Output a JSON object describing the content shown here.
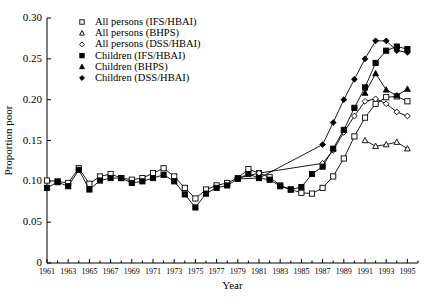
{
  "chart_data": {
    "type": "line",
    "title": "",
    "xlabel": "Year",
    "ylabel": "Proportion poor",
    "xlim": [
      1961,
      1996
    ],
    "ylim": [
      0,
      0.3
    ],
    "yticks": [
      "0",
      "0.05",
      "0.10",
      "0.15",
      "0.20",
      "0.25",
      "0.30"
    ],
    "ytick_values": [
      0,
      0.05,
      0.1,
      0.15,
      0.2,
      0.25,
      0.3
    ],
    "xticks": [
      "1961",
      "1963",
      "1965",
      "1967",
      "1969",
      "1971",
      "1973",
      "1975",
      "1977",
      "1979",
      "1981",
      "1983",
      "1985",
      "1987",
      "1989",
      "1991",
      "1993",
      "1995"
    ],
    "xtick_values": [
      1961,
      1963,
      1965,
      1967,
      1969,
      1971,
      1973,
      1975,
      1977,
      1979,
      1981,
      1983,
      1985,
      1987,
      1989,
      1991,
      1993,
      1995
    ],
    "minor_xticks": [
      1962,
      1964,
      1966,
      1968,
      1970,
      1972,
      1974,
      1976,
      1978,
      1980,
      1982,
      1984,
      1986,
      1988,
      1990,
      1992,
      1994,
      1996
    ],
    "grid": false,
    "legend_position": "top-center",
    "series": [
      {
        "name": "All persons (IFS/HBAI)",
        "marker": "open-square",
        "x": [
          1961,
          1962,
          1963,
          1964,
          1965,
          1966,
          1967,
          1968,
          1969,
          1970,
          1971,
          1972,
          1973,
          1974,
          1975,
          1976,
          1977,
          1978,
          1979,
          1980,
          1981,
          1982,
          1983,
          1984,
          1985,
          1986,
          1987,
          1988,
          1989,
          1990,
          1991,
          1992,
          1993,
          1994,
          1995
        ],
        "values": [
          0.101,
          0.1,
          0.098,
          0.116,
          0.097,
          0.106,
          0.109,
          0.104,
          0.102,
          0.104,
          0.11,
          0.116,
          0.106,
          0.092,
          0.079,
          0.09,
          0.095,
          0.098,
          0.104,
          0.115,
          0.11,
          0.105,
          0.095,
          0.09,
          0.086,
          0.085,
          0.092,
          0.106,
          0.128,
          0.155,
          0.178,
          0.195,
          0.203,
          0.204,
          0.198
        ]
      },
      {
        "name": "All persons (BHPS)",
        "marker": "open-triangle",
        "x": [
          1991,
          1992,
          1993,
          1994,
          1995
        ],
        "values": [
          0.15,
          0.143,
          0.145,
          0.148,
          0.14
        ]
      },
      {
        "name": "All persons (DSS/HBAI)",
        "marker": "open-diamond",
        "x": [
          1979,
          1981,
          1987,
          1988,
          1989,
          1990,
          1991,
          1992,
          1993,
          1994,
          1995
        ],
        "values": [
          0.104,
          0.11,
          0.122,
          0.138,
          0.16,
          0.18,
          0.198,
          0.201,
          0.195,
          0.185,
          0.18
        ]
      },
      {
        "name": "Children (IFS/HBAI)",
        "marker": "filled-square",
        "x": [
          1961,
          1962,
          1963,
          1964,
          1965,
          1966,
          1967,
          1968,
          1969,
          1970,
          1971,
          1972,
          1973,
          1974,
          1975,
          1976,
          1977,
          1978,
          1979,
          1980,
          1981,
          1982,
          1983,
          1984,
          1985,
          1986,
          1987,
          1988,
          1989,
          1990,
          1991,
          1992,
          1993,
          1994,
          1995
        ],
        "values": [
          0.092,
          0.099,
          0.094,
          0.114,
          0.09,
          0.101,
          0.104,
          0.104,
          0.098,
          0.1,
          0.104,
          0.108,
          0.1,
          0.084,
          0.068,
          0.085,
          0.092,
          0.095,
          0.103,
          0.109,
          0.104,
          0.102,
          0.094,
          0.09,
          0.093,
          0.109,
          0.118,
          0.14,
          0.163,
          0.19,
          0.215,
          0.245,
          0.26,
          0.265,
          0.262
        ]
      },
      {
        "name": "Children (BHPS)",
        "marker": "filled-triangle",
        "x": [
          1991,
          1992,
          1993,
          1994,
          1995
        ],
        "values": [
          0.208,
          0.232,
          0.212,
          0.205,
          0.213
        ]
      },
      {
        "name": "Children (DSS/HBAI)",
        "marker": "filled-diamond",
        "x": [
          1979,
          1981,
          1987,
          1988,
          1989,
          1990,
          1991,
          1992,
          1993,
          1994,
          1995
        ],
        "values": [
          0.103,
          0.104,
          0.145,
          0.172,
          0.2,
          0.225,
          0.25,
          0.272,
          0.272,
          0.26,
          0.258
        ]
      }
    ]
  },
  "legend": {
    "items": [
      {
        "label": "All persons (IFS/HBAI)",
        "marker": "open-square"
      },
      {
        "label": "All persons (BHPS)",
        "marker": "open-triangle"
      },
      {
        "label": "All persons (DSS/HBAI)",
        "marker": "open-diamond"
      },
      {
        "label": "Children (IFS/HBAI)",
        "marker": "filled-square"
      },
      {
        "label": "Children (BHPS)",
        "marker": "filled-triangle"
      },
      {
        "label": "Children (DSS/HBAI)",
        "marker": "filled-diamond"
      }
    ]
  },
  "colors": {
    "ink": "#000000",
    "background": "#ffffff"
  }
}
